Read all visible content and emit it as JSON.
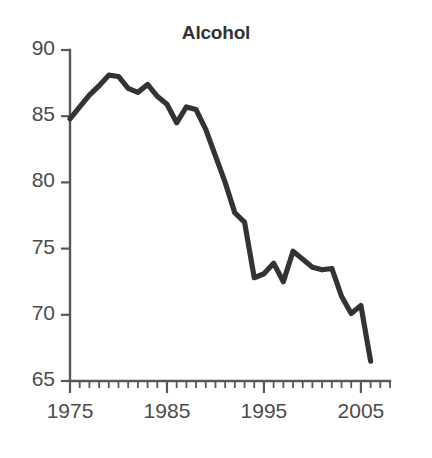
{
  "chart_data": {
    "type": "line",
    "title": "Alcohol",
    "xlabel": "",
    "ylabel": "",
    "xlim": [
      1975,
      2008
    ],
    "ylim": [
      65,
      90
    ],
    "grid": false,
    "legend": null,
    "x_tick_labels": [
      "1975",
      "1985",
      "1995",
      "2005"
    ],
    "x_major_ticks": [
      1975,
      1985,
      1995,
      2005
    ],
    "x_minor_tick_interval": 1,
    "y_tick_labels": [
      "90",
      "85",
      "80",
      "75",
      "70",
      "65"
    ],
    "y_ticks": [
      90,
      85,
      80,
      75,
      70,
      65
    ],
    "line_color": "#333335",
    "axis_color": "#58585a",
    "x": [
      1975,
      1976,
      1977,
      1978,
      1979,
      1980,
      1981,
      1982,
      1983,
      1984,
      1985,
      1986,
      1987,
      1988,
      1989,
      1990,
      1991,
      1992,
      1993,
      1994,
      1995,
      1996,
      1997,
      1998,
      1999,
      2000,
      2001,
      2002,
      2003,
      2004,
      2005,
      2006
    ],
    "values": [
      84.8,
      85.7,
      86.6,
      87.3,
      88.1,
      88.0,
      87.1,
      86.8,
      87.4,
      86.5,
      85.9,
      84.5,
      85.7,
      85.5,
      84.0,
      82.0,
      80.0,
      77.7,
      77.0,
      72.8,
      73.1,
      73.9,
      72.5,
      74.8,
      74.2,
      73.6,
      73.4,
      73.5,
      71.4,
      70.1,
      70.7,
      66.5
    ],
    "series_name": "Alcohol"
  },
  "figure": {
    "background": "#ffffff"
  }
}
